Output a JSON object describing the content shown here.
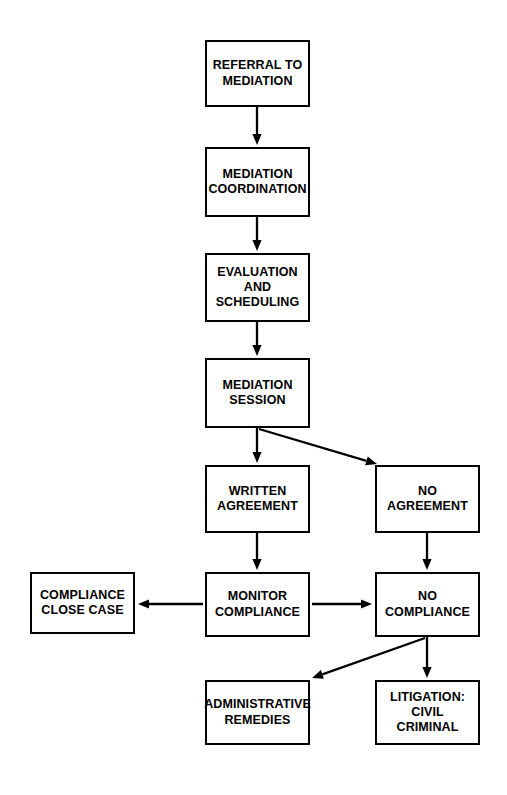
{
  "diagram": {
    "background_color": "#ffffff",
    "line_color": "#000000",
    "text_color": "#000000",
    "width": 507,
    "height": 795,
    "nodes": [
      {
        "id": "referral-to-mediation",
        "label": "REFERRAL TO\nMEDIATION",
        "x": 205,
        "y": 40,
        "w": 105,
        "h": 67
      },
      {
        "id": "mediation-coordination",
        "label": "MEDIATION\nCOORDINATION",
        "x": 205,
        "y": 147,
        "w": 105,
        "h": 70
      },
      {
        "id": "evaluation-and-scheduling",
        "label": "EVALUATION\nAND\nSCHEDULING",
        "x": 205,
        "y": 253,
        "w": 105,
        "h": 69
      },
      {
        "id": "mediation-session",
        "label": "MEDIATION\nSESSION",
        "x": 205,
        "y": 358,
        "w": 105,
        "h": 70
      },
      {
        "id": "written-agreement",
        "label": "WRITTEN\nAGREEMENT",
        "x": 205,
        "y": 465,
        "w": 105,
        "h": 68
      },
      {
        "id": "no-agreement",
        "label": "NO\nAGREEMENT",
        "x": 375,
        "y": 465,
        "w": 105,
        "h": 68
      },
      {
        "id": "compliance-close-case",
        "label": "COMPLIANCE\nCLOSE CASE",
        "x": 30,
        "y": 572,
        "w": 105,
        "h": 62
      },
      {
        "id": "monitor-compliance",
        "label": "MONITOR\nCOMPLIANCE",
        "x": 205,
        "y": 572,
        "w": 105,
        "h": 65
      },
      {
        "id": "no-compliance",
        "label": "NO\nCOMPLIANCE",
        "x": 375,
        "y": 572,
        "w": 105,
        "h": 65
      },
      {
        "id": "administrative-remedies",
        "label": "ADMINISTRATIVE\nREMEDIES",
        "x": 205,
        "y": 680,
        "w": 105,
        "h": 65
      },
      {
        "id": "litigation-civil-criminal",
        "label": "LITIGATION:\nCIVIL\nCRIMINAL",
        "x": 375,
        "y": 680,
        "w": 105,
        "h": 65
      }
    ],
    "edges": [
      {
        "id": "referral-to-coordination",
        "from": "referral-to-mediation",
        "to": "mediation-coordination",
        "x1": 257,
        "y1": 107,
        "x2": 257,
        "y2": 145
      },
      {
        "id": "coordination-to-evaluation",
        "from": "mediation-coordination",
        "to": "evaluation-and-scheduling",
        "x1": 257,
        "y1": 217,
        "x2": 257,
        "y2": 251
      },
      {
        "id": "evaluation-to-session",
        "from": "evaluation-and-scheduling",
        "to": "mediation-session",
        "x1": 257,
        "y1": 322,
        "x2": 257,
        "y2": 356
      },
      {
        "id": "session-to-written-agreement",
        "from": "mediation-session",
        "to": "written-agreement",
        "x1": 257,
        "y1": 428,
        "x2": 257,
        "y2": 463
      },
      {
        "id": "session-to-no-agreement",
        "from": "mediation-session",
        "to": "no-agreement",
        "x1": 259,
        "y1": 429,
        "x2": 377,
        "y2": 464
      },
      {
        "id": "written-agreement-to-monitor",
        "from": "written-agreement",
        "to": "monitor-compliance",
        "x1": 257,
        "y1": 533,
        "x2": 257,
        "y2": 570
      },
      {
        "id": "no-agreement-to-no-compliance",
        "from": "no-agreement",
        "to": "no-compliance",
        "x1": 427,
        "y1": 533,
        "x2": 427,
        "y2": 570
      },
      {
        "id": "monitor-to-compliance-close-case",
        "from": "monitor-compliance",
        "to": "compliance-close-case",
        "x1": 203,
        "y1": 604,
        "x2": 138,
        "y2": 604
      },
      {
        "id": "monitor-to-no-compliance",
        "from": "monitor-compliance",
        "to": "no-compliance",
        "x1": 312,
        "y1": 604,
        "x2": 372,
        "y2": 604
      },
      {
        "id": "no-compliance-to-administrative-remedies",
        "from": "no-compliance",
        "to": "administrative-remedies",
        "x1": 425,
        "y1": 638,
        "x2": 312,
        "y2": 678
      },
      {
        "id": "no-compliance-to-litigation",
        "from": "no-compliance",
        "to": "litigation-civil-criminal",
        "x1": 427,
        "y1": 637,
        "x2": 427,
        "y2": 678
      }
    ]
  }
}
